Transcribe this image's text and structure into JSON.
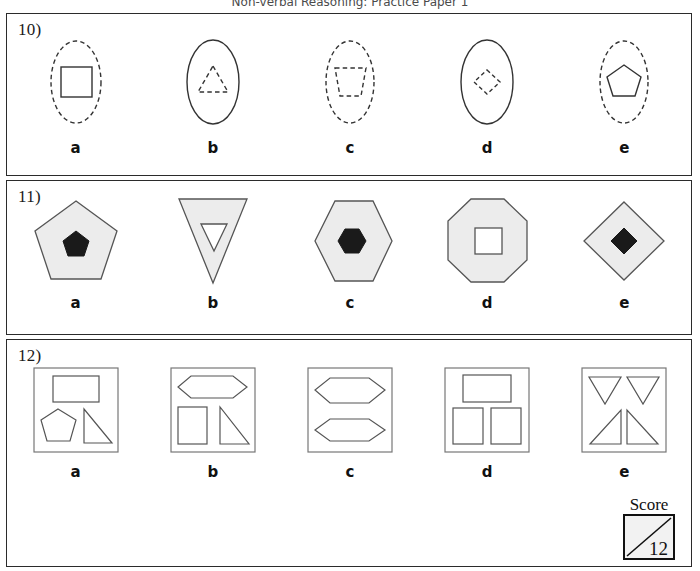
{
  "header": {
    "title": "Non-verbal Reasoning: Practice Paper 1"
  },
  "colors": {
    "panel_border": "#2b2b2b",
    "shape_stroke": "#333333",
    "shape_fill_gray": "#ececec",
    "shape_fill_black": "#1a1a1a",
    "shape_fill_white": "#ffffff",
    "page_background": "#ffffff"
  },
  "questions": [
    {
      "number": "10)",
      "options": [
        {
          "label": "a",
          "outer": "ellipse (dashed)",
          "inner": "square (solid)"
        },
        {
          "label": "b",
          "outer": "ellipse (solid)",
          "inner": "triangle (dashed)"
        },
        {
          "label": "c",
          "outer": "ellipse (dashed)",
          "inner": "trapezoid (dashed)"
        },
        {
          "label": "d",
          "outer": "ellipse (solid)",
          "inner": "diamond (dashed)"
        },
        {
          "label": "e",
          "outer": "ellipse (dashed)",
          "inner": "pentagon (solid)"
        }
      ]
    },
    {
      "number": "11)",
      "options": [
        {
          "label": "a",
          "outer": "pentagon (grey)",
          "inner": "pentagon (black)"
        },
        {
          "label": "b",
          "outer": "inverted-triangle (grey)",
          "inner": "inverted-triangle (white)"
        },
        {
          "label": "c",
          "outer": "hexagon (grey)",
          "inner": "hexagon (black)"
        },
        {
          "label": "d",
          "outer": "octagon (grey)",
          "inner": "square (white)"
        },
        {
          "label": "e",
          "outer": "diamond (grey)",
          "inner": "diamond (black)"
        }
      ]
    },
    {
      "number": "12)",
      "options": [
        {
          "label": "a",
          "outer": "square box",
          "inner": "rectangle, pentagon, right-triangle"
        },
        {
          "label": "b",
          "outer": "square box",
          "inner": "hexagon, rectangle, right-triangle"
        },
        {
          "label": "c",
          "outer": "square box",
          "inner": "hexagon, hexagon"
        },
        {
          "label": "d",
          "outer": "square box",
          "inner": "rectangle, rectangle, rectangle"
        },
        {
          "label": "e",
          "outer": "square box",
          "inner": "four triangles"
        }
      ]
    }
  ],
  "score": {
    "label": "Score",
    "value": "12"
  }
}
